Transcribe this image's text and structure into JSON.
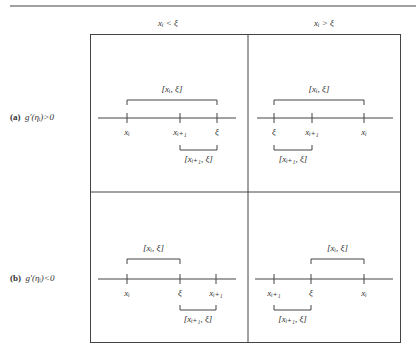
{
  "columns": [
    {
      "label": "xᵢ < ξ",
      "x": 168
    },
    {
      "label": "xᵢ > ξ",
      "x": 324
    }
  ],
  "rows": [
    {
      "tag": "(a)",
      "label": "g′(ηᵢ)>0",
      "y": 118
    },
    {
      "tag": "(b)",
      "label": "g′(ηᵢ)<0",
      "y": 279
    }
  ],
  "panels": [
    {
      "id": "a-left",
      "axis_y": 118,
      "x0": 98,
      "x1": 236,
      "ticks": [
        {
          "x": 127,
          "label": "xᵢ"
        },
        {
          "x": 180,
          "label": "xᵢ₊₁"
        },
        {
          "x": 217,
          "label": "ξ"
        }
      ],
      "top_bracket": {
        "x0": 127,
        "x1": 217,
        "y": 100,
        "label": "[xᵢ, ξ]"
      },
      "bottom_bracket": {
        "x0": 180,
        "x1": 217,
        "y": 150,
        "label": "[xᵢ₊₁, ξ]"
      }
    },
    {
      "id": "a-right",
      "axis_y": 118,
      "x0": 257,
      "x1": 393,
      "ticks": [
        {
          "x": 274,
          "label": "ξ"
        },
        {
          "x": 312,
          "label": "xᵢ₊₁"
        },
        {
          "x": 364,
          "label": "xᵢ"
        }
      ],
      "top_bracket": {
        "x0": 274,
        "x1": 364,
        "y": 100,
        "label": "[xᵢ, ξ]"
      },
      "bottom_bracket": {
        "x0": 274,
        "x1": 312,
        "y": 150,
        "label": "[xᵢ₊₁, ξ]"
      }
    },
    {
      "id": "b-left",
      "axis_y": 279,
      "x0": 98,
      "x1": 236,
      "ticks": [
        {
          "x": 127,
          "label": "xᵢ"
        },
        {
          "x": 180,
          "label": "ξ"
        },
        {
          "x": 216,
          "label": "xᵢ₊₁"
        }
      ],
      "top_bracket": {
        "x0": 127,
        "x1": 180,
        "y": 259,
        "label": "[xᵢ, ξ]"
      },
      "bottom_bracket": {
        "x0": 180,
        "x1": 216,
        "y": 310,
        "label": "[xᵢ₊₁, ξ]"
      }
    },
    {
      "id": "b-right",
      "axis_y": 279,
      "x0": 255,
      "x1": 393,
      "ticks": [
        {
          "x": 274,
          "label": "xᵢ₊₁"
        },
        {
          "x": 311,
          "label": "ξ"
        },
        {
          "x": 364,
          "label": "xᵢ"
        }
      ],
      "top_bracket": {
        "x0": 311,
        "x1": 364,
        "y": 259,
        "label": "[xᵢ, ξ]"
      },
      "bottom_bracket": {
        "x0": 274,
        "x1": 311,
        "y": 310,
        "label": "[xᵢ₊₁, ξ]"
      }
    }
  ],
  "colors": {
    "line": "#444444",
    "text": "#333333"
  }
}
